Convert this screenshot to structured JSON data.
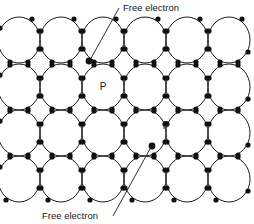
{
  "figure": {
    "kind": "crystal-lattice-diagram",
    "background_color": "#ffffff",
    "stroke_color": "#1a1a1a",
    "electron_color": "#111111",
    "width": 254,
    "height": 224
  },
  "lattice": {
    "columns": 6,
    "rows": 4,
    "circle_radius_x": 21,
    "circle_radius_y": 23,
    "column_centers_x": [
      19,
      61,
      103,
      145,
      187,
      229
    ],
    "row_centers_y": [
      40,
      87,
      133,
      179
    ],
    "bond_node_offset": 9,
    "electron_dot_radius": 2.6,
    "free_electron_dot_radius": 3.4
  },
  "dopants": [
    {
      "label": "P",
      "x": 103,
      "y": 87
    },
    {
      "label": "P",
      "x": 166,
      "y": 126
    }
  ],
  "free_electrons": [
    {
      "x": 89,
      "y": 61
    },
    {
      "x": 152,
      "y": 146
    }
  ],
  "callouts": [
    {
      "id": "callout-top",
      "label": "Free electron",
      "text_x": 123,
      "text_y": 11,
      "anchor": "start",
      "leader": {
        "x1": 119,
        "y1": 8,
        "x2": 90,
        "y2": 60
      }
    },
    {
      "id": "callout-bottom",
      "label": "Free electron",
      "text_x": 42,
      "text_y": 219,
      "anchor": "start",
      "leader": {
        "x1": 113,
        "y1": 216,
        "x2": 151,
        "y2": 147
      }
    }
  ]
}
